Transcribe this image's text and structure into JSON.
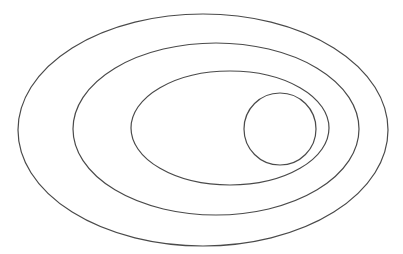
{
  "diagram": {
    "type": "nested-ellipses",
    "background": "#ffffff",
    "stroke_color": "#4a4a4a",
    "shapes": [
      {
        "name": "outer-ellipse",
        "cx": 203,
        "cy": 130,
        "rx": 185,
        "ry": 116
      },
      {
        "name": "second-ellipse",
        "cx": 216,
        "cy": 129,
        "rx": 143,
        "ry": 86
      },
      {
        "name": "third-ellipse",
        "cx": 230,
        "cy": 128,
        "rx": 99,
        "ry": 57
      },
      {
        "name": "inner-circle",
        "cx": 280,
        "cy": 129,
        "rx": 36,
        "ry": 36
      }
    ]
  }
}
